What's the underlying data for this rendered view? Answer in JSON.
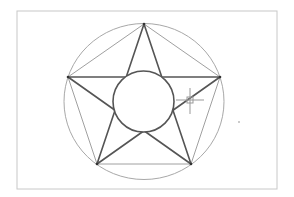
{
  "drawing": {
    "background": "#ffffff",
    "border": {
      "x": 17,
      "y": 11,
      "width": 260,
      "height": 178,
      "color": "#c8c8c8"
    },
    "outer_circle": {
      "cx": 144,
      "cy": 101.5,
      "rx": 80,
      "ry": 78,
      "color": "#a8a8a8"
    },
    "pentagon": {
      "points": "144,24 220,77 191,164 97,164 68,77",
      "color": "#a0a0a0"
    },
    "star": {
      "points": "144,24 191,164 68,77 220,77 97,164",
      "color": "#555555"
    },
    "inner_circle": {
      "cx": 143.5,
      "cy": 101.5,
      "r": 30.5,
      "color": "#555555"
    },
    "vertices": [
      [
        144,
        24
      ],
      [
        220,
        77
      ],
      [
        191,
        164
      ],
      [
        97,
        164
      ],
      [
        68,
        77
      ]
    ],
    "cursor": {
      "x": 190,
      "y": 100,
      "type": "crosshair-pickbox",
      "color": "#999999"
    },
    "stray_dot": {
      "x": 239,
      "y": 122
    }
  }
}
